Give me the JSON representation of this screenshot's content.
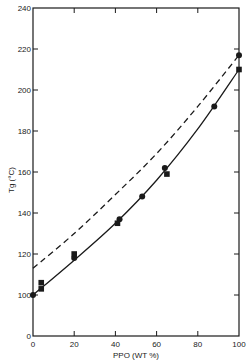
{
  "chart_data": {
    "type": "line",
    "title": "",
    "xlabel": "PPO (WT %)",
    "ylabel": "Tg (°C)",
    "xlim": [
      0,
      100
    ],
    "ylim": [
      0,
      240
    ],
    "y_axis_break": "between 0 and 100",
    "x_ticks": [
      "0",
      "20",
      "40",
      "60",
      "80",
      "100"
    ],
    "y_ticks": [
      "0",
      "100",
      "120",
      "140",
      "160",
      "180",
      "200",
      "220",
      "240"
    ],
    "grid": false,
    "legend": null,
    "series": [
      {
        "name": "measured (circles)",
        "marker": "circle",
        "x": [
          0,
          20,
          42,
          53,
          64,
          88,
          100
        ],
        "y": [
          100,
          118,
          137,
          148,
          162,
          192,
          217
        ]
      },
      {
        "name": "measured (squares)",
        "marker": "square",
        "x": [
          4,
          4,
          20,
          41,
          65,
          100
        ],
        "y": [
          106,
          103,
          120,
          135,
          159,
          210
        ]
      },
      {
        "name": "fit (solid)",
        "style": "solid",
        "x": [
          0,
          20,
          40,
          60,
          80,
          100
        ],
        "y": [
          100,
          117,
          135,
          156,
          181,
          210
        ]
      },
      {
        "name": "fit (dashed)",
        "style": "dashed",
        "x": [
          0,
          20,
          40,
          60,
          80,
          100
        ],
        "y": [
          113,
          130,
          149,
          169,
          192,
          217
        ]
      }
    ]
  }
}
